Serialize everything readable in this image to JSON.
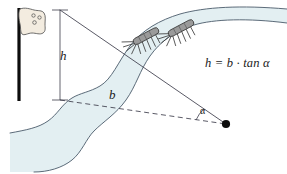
{
  "figure": {
    "labels": {
      "height": "h",
      "base": "b",
      "angle": "α",
      "formula": "h = b · tan α"
    },
    "colors": {
      "water_fill": "#e3eff2",
      "bank_stroke": "#4a5a6a",
      "line_stroke": "#3c3c4a",
      "pole": "#0d0d0d",
      "flag_fill": "#f3ece0",
      "flag_stroke": "#4a4a4a",
      "insect_fill": "#9a9a9a",
      "insect_stroke": "#3a3a3a",
      "dot": "#0d0d0d",
      "text": "#1a1a1a"
    },
    "elements": {
      "flagpole": "flagpole",
      "flag": "flag",
      "river": "river",
      "insects_count": 2,
      "sight_line": "sight-line",
      "baseline": "dashed-baseline",
      "height_dimension": "height-dimension",
      "observer_point": "observer-point",
      "angle_arc": "angle-arc"
    }
  }
}
